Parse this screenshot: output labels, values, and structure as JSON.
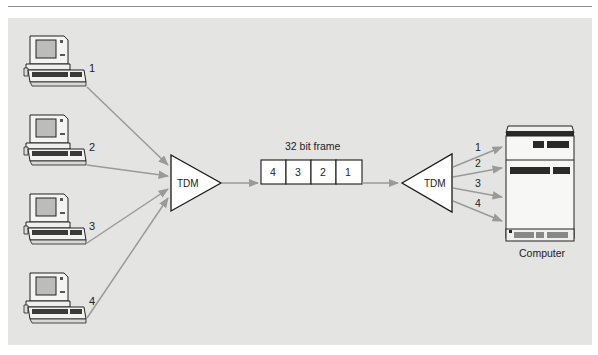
{
  "diagram": {
    "type": "Time Division Multiplexing",
    "terminals": [
      {
        "id": "1",
        "label": "1"
      },
      {
        "id": "2",
        "label": "2"
      },
      {
        "id": "3",
        "label": "3"
      },
      {
        "id": "4",
        "label": "4"
      }
    ],
    "multiplexer": {
      "label": "TDM"
    },
    "frame": {
      "title": "32 bit frame",
      "slots": [
        "4",
        "3",
        "2",
        "1"
      ]
    },
    "demultiplexer": {
      "label": "TDM"
    },
    "outputs": [
      "1",
      "2",
      "3",
      "4"
    ],
    "computer": {
      "label": "Computer"
    },
    "colors": {
      "background": "#e4e4e2",
      "arrow": "#9a9a9a",
      "outline": "#1a1a1a"
    }
  }
}
